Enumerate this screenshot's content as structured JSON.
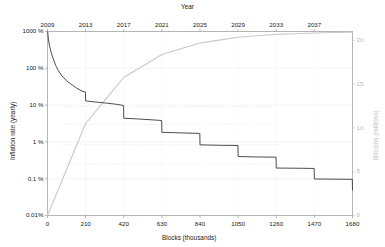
{
  "figure": {
    "title_top_axis": "Year",
    "xlabel": "Blocks (thousands)",
    "ylabel_left": "Inflation rate (yearly)",
    "ylabel_right": "Bitcoins (millions)",
    "bg_color": "#ffffff",
    "inflation_color": "#4d4d4d",
    "supply_color": "#c9c9c9",
    "axis_color": "#9a9a9a",
    "grid_color": "#e8e8e8"
  },
  "axes": {
    "x_ticks": [
      "0",
      "210",
      "420",
      "630",
      "840",
      "1050",
      "1260",
      "1470",
      "1680"
    ],
    "x_values": [
      0,
      210,
      420,
      630,
      840,
      1050,
      1260,
      1470,
      1680
    ],
    "x_range": [
      0,
      1680
    ],
    "top_ticks": [
      "2009",
      "2013",
      "2017",
      "2021",
      "2025",
      "2029",
      "2033",
      "2037"
    ],
    "top_values": [
      2009,
      2013,
      2017,
      2021,
      2025,
      2029,
      2033,
      2037
    ],
    "y_left_ticks": [
      "1000 %",
      "100 %",
      "10 %",
      "1 %",
      "0.1 %",
      "0.01%"
    ],
    "y_left_values": [
      1000,
      100,
      10,
      1,
      0.1,
      0.01
    ],
    "y_left_scale": "log",
    "y_left_range": [
      0.01,
      1000
    ],
    "y_right_ticks": [
      "20",
      "15",
      "10",
      "5",
      "0"
    ],
    "y_right_values": [
      20,
      15,
      10,
      5,
      0
    ],
    "y_right_range": [
      0,
      21
    ],
    "grid": "horizontal-faint"
  },
  "chart_data": {
    "type": "line",
    "title": "",
    "xlabel": "Blocks (thousands)",
    "ylabel": "Inflation rate (yearly)",
    "xlim": [
      0,
      1680
    ],
    "ylim": [
      0.01,
      1000
    ],
    "legend": "none",
    "series": [
      {
        "name": "Inflation rate (yearly)",
        "axis": "left",
        "units": "percent",
        "scale": "log",
        "color": "#4d4d4d",
        "style": "step-decay",
        "x": [
          1,
          5,
          10,
          20,
          30,
          45,
          60,
          80,
          105,
          130,
          160,
          190,
          209,
          210,
          260,
          320,
          380,
          419,
          420,
          500,
          600,
          629,
          630,
          700,
          800,
          839,
          840,
          950,
          1049,
          1050,
          1150,
          1259,
          1260,
          1400,
          1469,
          1470,
          1600,
          1679,
          1680
        ],
        "y": [
          1000,
          620,
          430,
          270,
          190,
          120,
          86,
          62,
          46,
          37,
          29,
          24,
          22.5,
          13.0,
          12.2,
          11.4,
          10.5,
          9.8,
          4.4,
          4.2,
          3.9,
          3.8,
          1.82,
          1.78,
          1.72,
          1.7,
          0.83,
          0.81,
          0.8,
          0.4,
          0.39,
          0.385,
          0.195,
          0.192,
          0.19,
          0.098,
          0.097,
          0.096,
          0.048
        ]
      },
      {
        "name": "Bitcoins (millions)",
        "axis": "right",
        "units": "millions",
        "scale": "linear",
        "color": "#c9c9c9",
        "style": "cumulative",
        "x": [
          0,
          105,
          210,
          315,
          420,
          525,
          630,
          735,
          840,
          945,
          1050,
          1155,
          1260,
          1365,
          1470,
          1575,
          1680
        ],
        "y": [
          0.0,
          5.25,
          10.5,
          13.13,
          15.75,
          17.06,
          18.38,
          19.03,
          19.69,
          20.02,
          20.34,
          20.51,
          20.67,
          20.75,
          20.83,
          20.88,
          20.92
        ]
      }
    ],
    "halvings": [
      {
        "block": 210,
        "rate_before": 22.5,
        "rate_after": 13.0
      },
      {
        "block": 420,
        "rate_before": 9.8,
        "rate_after": 4.4
      },
      {
        "block": 630,
        "rate_before": 3.8,
        "rate_after": 1.82
      },
      {
        "block": 840,
        "rate_before": 1.7,
        "rate_after": 0.83
      },
      {
        "block": 1050,
        "rate_before": 0.8,
        "rate_after": 0.4
      },
      {
        "block": 1260,
        "rate_before": 0.385,
        "rate_after": 0.195
      },
      {
        "block": 1470,
        "rate_before": 0.19,
        "rate_after": 0.098
      },
      {
        "block": 1680,
        "rate_before": 0.096,
        "rate_after": 0.048
      }
    ]
  },
  "watermark": {
    "visible": true,
    "note": "faint show-through text from reverse of page"
  }
}
